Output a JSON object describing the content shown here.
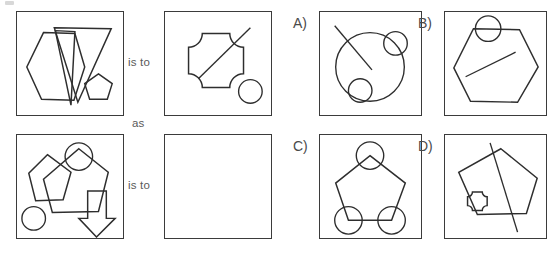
{
  "puzzle": {
    "type": "visual-analogy",
    "relation_labels": {
      "top_is_to": "is to",
      "as": "as",
      "bottom_is_to": "is to"
    },
    "stroke_color": "#2e2e2e",
    "frame_color": "#3b3b3b",
    "text_color": "#5a5a5a",
    "background": "#ffffff"
  },
  "prompt": {
    "top_row": {
      "left_panel": {
        "name": "panel-A1",
        "shapes": [
          {
            "kind": "hexagon",
            "label": "large hexagon"
          },
          {
            "kind": "triangle",
            "label": "large inverted triangle"
          },
          {
            "kind": "triangle",
            "label": "narrow inverted triangle"
          },
          {
            "kind": "pentagon",
            "label": "small pentagon"
          }
        ],
        "shape_count": 4
      },
      "right_panel": {
        "name": "panel-A2",
        "shapes": [
          {
            "kind": "concave-cross",
            "label": "cross with concave corners"
          },
          {
            "kind": "line",
            "label": "diagonal line"
          },
          {
            "kind": "circle",
            "label": "small circle"
          }
        ],
        "shape_count": 3
      }
    },
    "bottom_row": {
      "left_panel": {
        "name": "panel-B1",
        "shapes": [
          {
            "kind": "pentagon",
            "label": "large pentagon"
          },
          {
            "kind": "pentagon",
            "label": "small pentagon"
          },
          {
            "kind": "circle",
            "label": "circle on vertex"
          },
          {
            "kind": "circle",
            "label": "small circle lower left"
          },
          {
            "kind": "arrow",
            "label": "down arrow"
          }
        ],
        "shape_count": 5
      },
      "right_panel": {
        "name": "panel-B2-answer-blank",
        "shapes": [],
        "shape_count": 0,
        "is_blank": true
      }
    }
  },
  "options": [
    {
      "id": "A",
      "label": "A)",
      "name": "option-a",
      "shapes": [
        {
          "kind": "circle",
          "label": "large circle"
        },
        {
          "kind": "circle",
          "label": "small circle upper right"
        },
        {
          "kind": "circle",
          "label": "small circle lower left"
        },
        {
          "kind": "line",
          "label": "diagonal line"
        }
      ]
    },
    {
      "id": "B",
      "label": "B)",
      "name": "option-b",
      "shapes": [
        {
          "kind": "hexagon",
          "label": "hexagon"
        },
        {
          "kind": "circle",
          "label": "circle on top edge"
        },
        {
          "kind": "line",
          "label": "diagonal line"
        }
      ]
    },
    {
      "id": "C",
      "label": "C)",
      "name": "option-c",
      "shapes": [
        {
          "kind": "pentagon",
          "label": "pentagon"
        },
        {
          "kind": "circle",
          "label": "circle at apex"
        },
        {
          "kind": "circle",
          "label": "circle at lower left vertex"
        },
        {
          "kind": "circle",
          "label": "circle at lower right vertex"
        }
      ]
    },
    {
      "id": "D",
      "label": "D)",
      "name": "option-d",
      "shapes": [
        {
          "kind": "pentagon",
          "label": "tilted pentagon"
        },
        {
          "kind": "line",
          "label": "long diagonal line"
        },
        {
          "kind": "concave-cross",
          "label": "small concave cross"
        }
      ]
    }
  ]
}
